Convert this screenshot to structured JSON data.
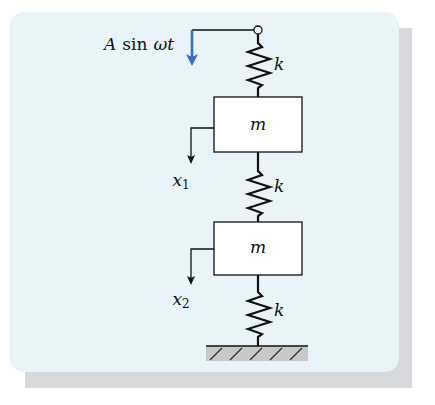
{
  "figure": {
    "type": "two-mass spring system with base excitation",
    "forcing_label": {
      "prefix": "A",
      "func": "sin",
      "arg": "ωt"
    },
    "springs": [
      {
        "label": "k"
      },
      {
        "label": "k"
      },
      {
        "label": "k"
      }
    ],
    "masses": [
      {
        "label": "m",
        "displacement": {
          "symbol": "x",
          "sub": "1"
        }
      },
      {
        "label": "m",
        "displacement": {
          "symbol": "x",
          "sub": "2"
        }
      }
    ],
    "ground": "fixed support (hatched)"
  },
  "colors": {
    "card_background": "#e8f4fa",
    "card_shadow": "#d6d8dc",
    "forcing_arrow": "#3a6fc4",
    "lines": "#111111",
    "ground_fill": "#c8c8c8"
  }
}
